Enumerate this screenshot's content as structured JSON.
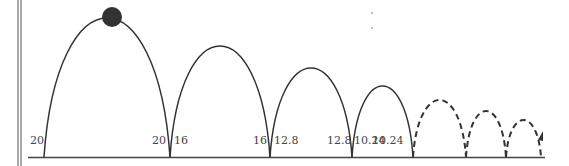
{
  "diagram": {
    "labels": [
      {
        "text": "20",
        "x": 30,
        "y": 144
      },
      {
        "text": "20",
        "x": 152,
        "y": 144
      },
      {
        "text": "16",
        "x": 174,
        "y": 144
      },
      {
        "text": "16",
        "x": 253,
        "y": 144
      },
      {
        "text": "12.8",
        "x": 274,
        "y": 144
      },
      {
        "text": "12.8",
        "x": 327,
        "y": 144
      },
      {
        "text": "10.24",
        "x": 354,
        "y": 144
      },
      {
        "text": "10.24",
        "x": 372,
        "y": 144
      }
    ],
    "arcs": [
      {
        "from": 44,
        "to": 170,
        "peak": 18,
        "style": "solid"
      },
      {
        "from": 170,
        "to": 270,
        "peak": 46,
        "style": "solid"
      },
      {
        "from": 270,
        "to": 352,
        "peak": 68,
        "style": "solid"
      },
      {
        "from": 352,
        "to": 413,
        "peak": 86,
        "style": "solid"
      },
      {
        "from": 413,
        "to": 466,
        "peak": 100,
        "style": "dashed"
      },
      {
        "from": 466,
        "to": 506,
        "peak": 111,
        "style": "dashed"
      },
      {
        "from": 506,
        "to": 541,
        "peak": 120,
        "style": "dashed"
      }
    ],
    "ball": {
      "cx": 112,
      "cy": 17,
      "r": 10,
      "color": "#333333"
    }
  }
}
